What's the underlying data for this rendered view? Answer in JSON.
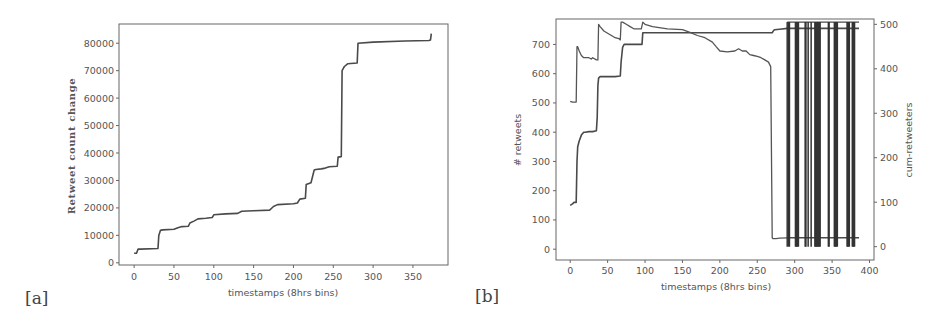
{
  "chart_data": [
    {
      "panel": "[a]",
      "type": "line",
      "title": "",
      "xlabel": "timestamps (8hrs bins)",
      "ylabel": "Retweet count change",
      "xlim": [
        -19,
        394
      ],
      "ylim": [
        -800,
        87000
      ],
      "xticks": [
        0,
        50,
        100,
        150,
        200,
        250,
        300,
        350
      ],
      "yticks": [
        0,
        10000,
        20000,
        30000,
        40000,
        50000,
        60000,
        70000,
        80000
      ],
      "grid": false,
      "series": [
        {
          "name": "retweet-count-change",
          "x": [
            0,
            3,
            5,
            8,
            30,
            31,
            33,
            36,
            50,
            55,
            60,
            68,
            70,
            75,
            80,
            90,
            98,
            100,
            115,
            130,
            135,
            150,
            170,
            175,
            180,
            200,
            205,
            208,
            215,
            216,
            222,
            226,
            228,
            235,
            240,
            245,
            255,
            256,
            260,
            261,
            263,
            264,
            268,
            272,
            280,
            281,
            300,
            340,
            370,
            372,
            373
          ],
          "y": [
            3500,
            3500,
            5000,
            5000,
            5200,
            10000,
            11800,
            12000,
            12200,
            12800,
            13200,
            13300,
            14500,
            15200,
            16000,
            16200,
            16500,
            17500,
            17800,
            18000,
            18800,
            19000,
            19200,
            20500,
            21200,
            21500,
            21800,
            23200,
            23500,
            28500,
            29200,
            33800,
            34000,
            34200,
            34500,
            35000,
            35200,
            38500,
            38700,
            70000,
            71000,
            71500,
            72500,
            72600,
            72800,
            80000,
            80400,
            80800,
            81000,
            81200,
            83500
          ]
        }
      ]
    },
    {
      "panel": "[b]",
      "type": "line",
      "title": "",
      "xlabel": "timestamps (8hrs bins)",
      "ylabel": "# retweets",
      "ylabel_right": "cum-retweeters",
      "xlim": [
        -19,
        406
      ],
      "ylim": [
        -37,
        787
      ],
      "ylim_right": [
        -30,
        512
      ],
      "xticks": [
        0,
        50,
        100,
        150,
        200,
        250,
        300,
        350,
        400
      ],
      "yticks": [
        0,
        100,
        200,
        300,
        400,
        500,
        600,
        700
      ],
      "yticks_right": [
        0,
        100,
        200,
        300,
        400,
        500
      ],
      "grid": false,
      "series": [
        {
          "name": "cumulative-retweets-step",
          "axis": "left",
          "x": [
            0,
            3,
            5,
            8,
            9,
            10,
            12,
            15,
            18,
            20,
            25,
            30,
            35,
            36,
            37,
            38,
            40,
            50,
            60,
            67,
            68,
            70,
            72,
            80,
            96,
            97,
            100,
            150,
            200,
            250,
            270,
            272,
            273,
            280,
            290,
            290.01
          ],
          "y": [
            150,
            155,
            160,
            160,
            300,
            350,
            370,
            390,
            400,
            400,
            402,
            402,
            405,
            450,
            560,
            585,
            590,
            590,
            590,
            592,
            640,
            690,
            700,
            700,
            700,
            740,
            740,
            740,
            740,
            740,
            740,
            748,
            750,
            752,
            755,
            755
          ]
        },
        {
          "name": "retweeters-per-bin",
          "axis": "right",
          "x": [
            0,
            3,
            6,
            8,
            9,
            10,
            12,
            15,
            18,
            20,
            25,
            28,
            30,
            35,
            37,
            38,
            40,
            45,
            50,
            55,
            60,
            65,
            67,
            68,
            70,
            75,
            80,
            85,
            95,
            97,
            100,
            110,
            130,
            150,
            160,
            170,
            180,
            190,
            195,
            200,
            210,
            220,
            225,
            230,
            235,
            240,
            245,
            250,
            255,
            260,
            265,
            268,
            270,
            271,
            272,
            275,
            280,
            290
          ],
          "y": [
            327,
            325,
            325,
            325,
            450,
            450,
            440,
            430,
            425,
            425,
            425,
            422,
            425,
            420,
            420,
            500,
            495,
            485,
            480,
            475,
            470,
            468,
            465,
            505,
            505,
            500,
            495,
            490,
            490,
            505,
            500,
            495,
            490,
            488,
            482,
            475,
            470,
            460,
            450,
            440,
            438,
            440,
            445,
            440,
            440,
            432,
            430,
            428,
            425,
            420,
            415,
            405,
            20,
            18,
            18,
            18,
            19,
            20
          ]
        },
        {
          "name": "oscillating-tail",
          "axis": "right",
          "note": "rapid alternation between ~0 and ~505 after t=290",
          "spike_x": [
            290,
            292,
            293,
            301,
            302,
            303,
            304,
            305,
            314,
            315,
            318,
            322,
            327,
            328,
            329,
            330,
            331,
            332,
            333,
            334,
            345,
            346,
            353,
            354,
            355,
            356,
            357,
            370,
            371,
            372,
            373,
            377,
            378,
            379,
            380
          ],
          "high": 505,
          "low": 0,
          "baseline_after": 20,
          "end_x": 386
        }
      ]
    }
  ],
  "panels": {
    "a": {
      "label": "[a]"
    },
    "b": {
      "label": "[b]"
    }
  }
}
